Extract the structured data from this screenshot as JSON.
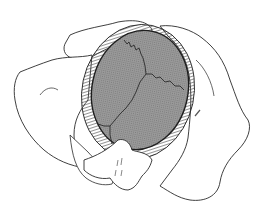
{
  "figure": {
    "colors": {
      "background": "#ffffff",
      "outline": "#2a2a2a",
      "skull_fill": "#8f8f8f",
      "tissue_hatch": "#5a5a5a",
      "bone_fill": "#ffffff"
    },
    "labels": []
  }
}
